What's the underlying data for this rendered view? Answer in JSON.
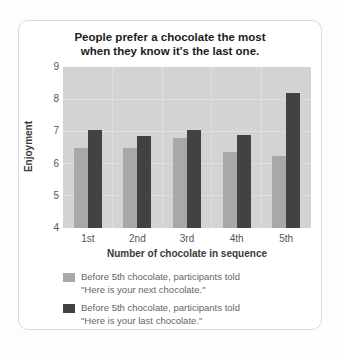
{
  "chart_data": {
    "type": "bar",
    "title": "People prefer a chocolate the most when they know it's the last one.",
    "title_lines": [
      "People prefer a chocolate the most",
      "when they know it's the last one."
    ],
    "categories": [
      "1st",
      "2nd",
      "3rd",
      "4th",
      "5th"
    ],
    "series": [
      {
        "name": "Before 5th chocolate, participants told \"Here is your next chocolate.\"",
        "color": "#a8a8a8",
        "values": [
          6.5,
          6.5,
          6.8,
          6.35,
          6.25
        ]
      },
      {
        "name": "Before 5th chocolate, participants told \"Here is your last chocolate.\"",
        "color": "#424242",
        "values": [
          7.05,
          6.85,
          7.05,
          6.9,
          8.2
        ]
      }
    ],
    "xlabel": "Number of chocolate in sequence",
    "ylabel": "Enjoyment",
    "ylim": [
      4,
      9
    ],
    "yticks": [
      9,
      8,
      7,
      6,
      5,
      4
    ],
    "grid": true,
    "legend_position": "bottom",
    "plot_bg": "#d3d3d3",
    "grid_color": "#dfdfdf",
    "legend_items": [
      {
        "line1": "Before 5th chocolate, participants told",
        "line2": "\"Here is your next chocolate.\""
      },
      {
        "line1": "Before 5th chocolate, participants told",
        "line2": "\"Here is your last chocolate.\""
      }
    ]
  }
}
